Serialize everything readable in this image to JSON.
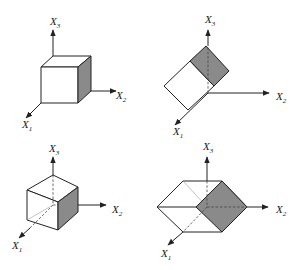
{
  "colors": {
    "shaded_face": "#8a8a8a",
    "line": "#222222",
    "background": "#ffffff"
  },
  "panels": [
    {
      "id": "top-left",
      "description": "Cube aligned with axes, shaded face on X2 side",
      "axes": {
        "x1": {
          "main": "X",
          "sub": "1"
        },
        "x2": {
          "main": "X",
          "sub": "2"
        },
        "x3": {
          "main": "X",
          "sub": "3"
        }
      }
    },
    {
      "id": "top-right",
      "description": "Cube rotated 45 degrees about X1 axis, shaded face",
      "axes": {
        "x1": {
          "main": "X",
          "sub": "1"
        },
        "x2": {
          "main": "X",
          "sub": "2"
        },
        "x3": {
          "main": "X",
          "sub": "3"
        }
      }
    },
    {
      "id": "bottom-left",
      "description": "Cube centered at origin, shaded face on X2 side",
      "axes": {
        "x1": {
          "main": "X",
          "sub": "1"
        },
        "x2": {
          "main": "X",
          "sub": "2"
        },
        "x3": {
          "main": "X",
          "sub": "3"
        }
      }
    },
    {
      "id": "bottom-right",
      "description": "Cube rotated 45 degrees about X3 axis, centered at origin, shaded diamond face",
      "axes": {
        "x1": {
          "main": "X",
          "sub": "1"
        },
        "x2": {
          "main": "X",
          "sub": "2"
        },
        "x3": {
          "main": "X",
          "sub": "3"
        }
      }
    }
  ]
}
